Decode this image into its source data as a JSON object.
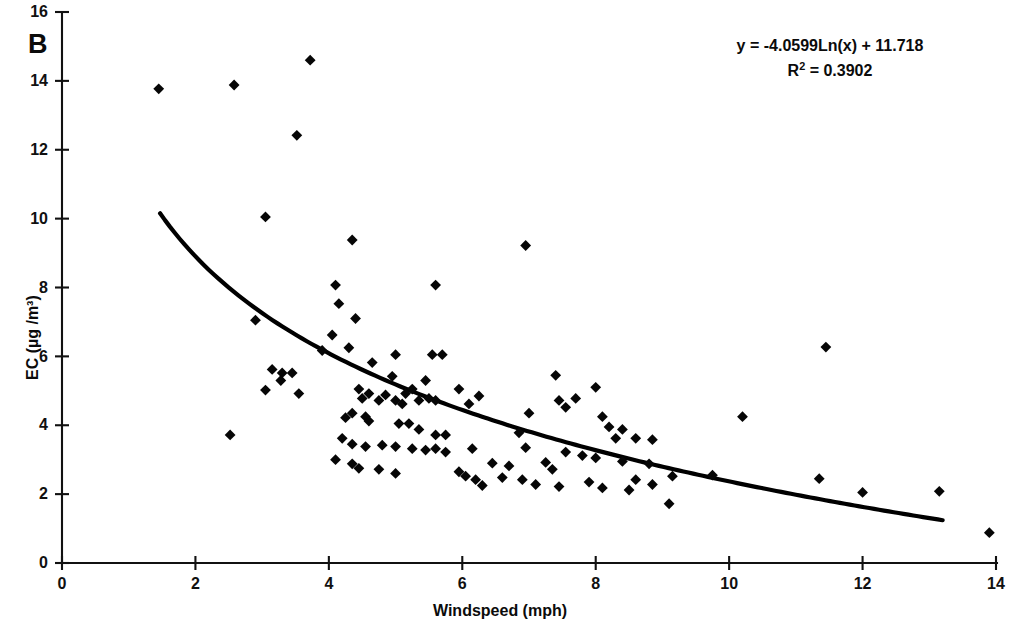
{
  "figure": {
    "panel_label": "B",
    "background_color": "#ffffff",
    "marker_color": "#060606",
    "line_color": "#000000"
  },
  "annotation": {
    "equation": "y = -4.0599Ln(x) + 11.718",
    "r_squared_prefix": "R",
    "r_squared_exponent": "2",
    "r_squared_value": " = 0.3902"
  },
  "chart_data": {
    "type": "scatter",
    "title": "B",
    "xlabel": "Windspeed (mph)",
    "ylabel": "EC (µg /m³)",
    "xlim": [
      0,
      14
    ],
    "ylim": [
      0,
      16
    ],
    "xticks": [
      0,
      2,
      4,
      6,
      8,
      10,
      12,
      14
    ],
    "yticks": [
      0,
      2,
      4,
      6,
      8,
      10,
      12,
      14,
      16
    ],
    "xtick_labels": [
      "0",
      "2",
      "4",
      "6",
      "8",
      "10",
      "12",
      "14"
    ],
    "ytick_labels": [
      "0",
      "2",
      "4",
      "6",
      "8",
      "10",
      "12",
      "14",
      "16"
    ],
    "grid": false,
    "legend": false,
    "marker": "diamond",
    "fit": {
      "type": "logarithmic",
      "equation": "y = -4.0599Ln(x) + 11.718",
      "r_squared": 0.3902,
      "slope": -4.0599,
      "intercept": 11.718,
      "x_start": 1.47,
      "x_end": 13.2
    },
    "points": [
      [
        1.45,
        13.77
      ],
      [
        2.58,
        13.88
      ],
      [
        3.72,
        14.6
      ],
      [
        3.52,
        12.42
      ],
      [
        3.05,
        10.05
      ],
      [
        4.35,
        9.38
      ],
      [
        6.95,
        9.22
      ],
      [
        4.1,
        8.07
      ],
      [
        5.6,
        8.07
      ],
      [
        4.15,
        7.53
      ],
      [
        2.9,
        7.05
      ],
      [
        4.4,
        7.1
      ],
      [
        4.05,
        6.62
      ],
      [
        4.3,
        6.25
      ],
      [
        11.45,
        6.27
      ],
      [
        5.0,
        6.05
      ],
      [
        5.55,
        6.05
      ],
      [
        5.7,
        6.05
      ],
      [
        3.9,
        6.17
      ],
      [
        4.65,
        5.82
      ],
      [
        3.15,
        5.62
      ],
      [
        3.3,
        5.52
      ],
      [
        3.28,
        5.3
      ],
      [
        3.45,
        5.52
      ],
      [
        3.05,
        5.02
      ],
      [
        3.55,
        4.92
      ],
      [
        4.95,
        5.42
      ],
      [
        5.25,
        5.05
      ],
      [
        5.45,
        5.3
      ],
      [
        5.95,
        5.05
      ],
      [
        7.4,
        5.45
      ],
      [
        8.0,
        5.1
      ],
      [
        7.7,
        4.78
      ],
      [
        7.45,
        4.72
      ],
      [
        7.55,
        4.52
      ],
      [
        4.45,
        5.05
      ],
      [
        4.5,
        4.78
      ],
      [
        4.6,
        4.92
      ],
      [
        4.75,
        4.72
      ],
      [
        4.85,
        4.88
      ],
      [
        5.0,
        4.72
      ],
      [
        5.1,
        4.62
      ],
      [
        5.15,
        4.92
      ],
      [
        5.35,
        4.72
      ],
      [
        5.5,
        4.78
      ],
      [
        5.6,
        4.72
      ],
      [
        6.1,
        4.62
      ],
      [
        6.25,
        4.85
      ],
      [
        7.0,
        4.35
      ],
      [
        8.1,
        4.25
      ],
      [
        10.2,
        4.25
      ],
      [
        4.25,
        4.22
      ],
      [
        4.35,
        4.35
      ],
      [
        4.55,
        4.25
      ],
      [
        4.6,
        4.12
      ],
      [
        2.52,
        3.72
      ],
      [
        5.05,
        4.05
      ],
      [
        5.2,
        4.05
      ],
      [
        5.35,
        3.88
      ],
      [
        5.6,
        3.72
      ],
      [
        5.75,
        3.72
      ],
      [
        6.85,
        3.78
      ],
      [
        8.2,
        3.95
      ],
      [
        8.4,
        3.88
      ],
      [
        8.3,
        3.62
      ],
      [
        8.6,
        3.62
      ],
      [
        8.85,
        3.58
      ],
      [
        4.2,
        3.62
      ],
      [
        4.35,
        3.45
      ],
      [
        4.55,
        3.38
      ],
      [
        4.8,
        3.42
      ],
      [
        5.0,
        3.38
      ],
      [
        5.25,
        3.32
      ],
      [
        5.45,
        3.28
      ],
      [
        5.6,
        3.32
      ],
      [
        5.75,
        3.22
      ],
      [
        6.15,
        3.32
      ],
      [
        6.95,
        3.35
      ],
      [
        7.55,
        3.22
      ],
      [
        7.8,
        3.12
      ],
      [
        8.0,
        3.05
      ],
      [
        8.4,
        2.95
      ],
      [
        8.8,
        2.88
      ],
      [
        4.1,
        3.0
      ],
      [
        4.35,
        2.88
      ],
      [
        4.45,
        2.75
      ],
      [
        4.75,
        2.72
      ],
      [
        6.45,
        2.9
      ],
      [
        6.7,
        2.82
      ],
      [
        7.25,
        2.92
      ],
      [
        7.35,
        2.72
      ],
      [
        6.2,
        2.42
      ],
      [
        6.3,
        2.25
      ],
      [
        6.6,
        2.48
      ],
      [
        6.9,
        2.42
      ],
      [
        7.1,
        2.28
      ],
      [
        7.45,
        2.22
      ],
      [
        7.9,
        2.35
      ],
      [
        8.1,
        2.18
      ],
      [
        8.5,
        2.12
      ],
      [
        8.6,
        2.42
      ],
      [
        8.85,
        2.28
      ],
      [
        9.15,
        2.52
      ],
      [
        9.1,
        1.72
      ],
      [
        9.75,
        2.55
      ],
      [
        11.35,
        2.45
      ],
      [
        12.0,
        2.05
      ],
      [
        13.15,
        2.08
      ],
      [
        13.9,
        0.88
      ],
      [
        5.0,
        2.6
      ],
      [
        5.95,
        2.65
      ],
      [
        6.05,
        2.52
      ]
    ]
  }
}
